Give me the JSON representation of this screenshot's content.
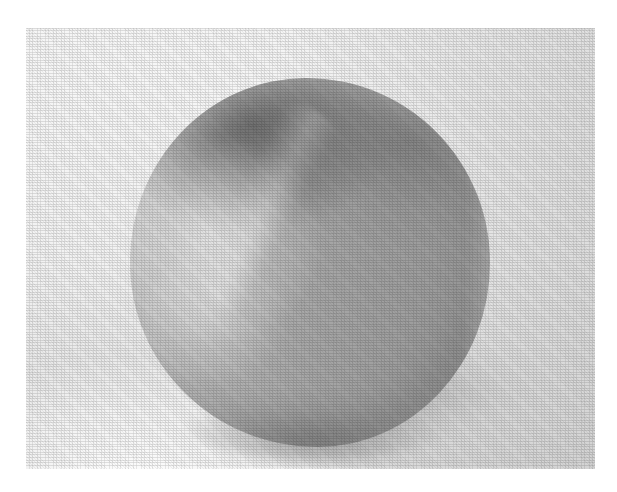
{
  "page": {
    "background_color": "#ffffff",
    "width_px": 617,
    "height_px": 492
  },
  "photograph": {
    "name": "grayscale-photograph",
    "description": "Black-and-white halftone-printed photograph of a single rounded ball-like object resting on a light surface",
    "frame": {
      "left_px": 26,
      "top_px": 28,
      "width_px": 569,
      "height_px": 441,
      "border": "none"
    },
    "backdrop": {
      "label": "seamless light backdrop",
      "base_color": "#f2f2f2",
      "highlight_color": "#f8f8f8",
      "falloff_color": "#dcdcdc"
    },
    "subject": {
      "label": "rounded ball",
      "shape": "irregular sphere / rounded blob",
      "bounding_box": {
        "left_px": 130,
        "top_px": 78,
        "right_px": 490,
        "bottom_px": 447
      },
      "tones": {
        "highlight": "#d2d2d2",
        "midtone": "#b0b0b0",
        "shadow": "#9a9a9a",
        "deep_shadow": "#7e7e7e"
      },
      "lighting": {
        "key_light_direction": "upper-left",
        "specular_region": "left flank",
        "dark_ridge_region": "upper-left shoulder",
        "terminator_side": "right"
      }
    },
    "cast_shadow": {
      "label": "soft cast shadow",
      "position": "below and to the right of the subject",
      "color": "#8c8c8c",
      "opacity": 0.4
    },
    "texture": {
      "label": "halftone print screen",
      "pattern": "orthogonal dot grid with diagonal rosette",
      "visible": true
    }
  }
}
